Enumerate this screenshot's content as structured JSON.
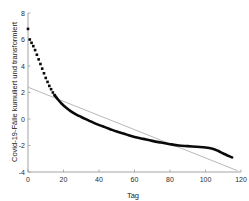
{
  "chart_data": {
    "type": "line",
    "title": "",
    "xlabel": "Tag",
    "ylabel": "Covid-19-Fälle kumuliert und transformiert",
    "xlim": [
      0,
      120
    ],
    "ylim": [
      -4,
      8
    ],
    "xticks": [
      0,
      20,
      40,
      60,
      80,
      100,
      120
    ],
    "xticklabels": [
      "0",
      "20",
      "40",
      "60",
      "80",
      "100",
      "120"
    ],
    "yticks": [
      -4,
      -2,
      0,
      2,
      4,
      6,
      8
    ],
    "yticklabels": [
      "-4",
      "-2",
      "0",
      "2",
      "4",
      "6",
      "8"
    ],
    "grid": false,
    "legend": null,
    "series": [
      {
        "name": "Beobachtet (gepunktet, früh)",
        "style": "markers-square",
        "color": "#0a0a0a",
        "x": [
          0,
          1,
          2,
          3,
          4,
          5,
          6,
          7,
          8,
          9,
          10,
          11,
          12,
          13,
          14,
          15
        ],
        "y": [
          6.8,
          6.0,
          5.75,
          5.5,
          5.2,
          4.85,
          4.5,
          4.15,
          3.8,
          3.45,
          3.1,
          2.8,
          2.5,
          2.25,
          2.0,
          1.8
        ]
      },
      {
        "name": "Beobachtet (durchgezogen, dick)",
        "style": "thick-line",
        "color": "#0a0a0a",
        "x": [
          15,
          17,
          19,
          21,
          24,
          27,
          30,
          34,
          38,
          42,
          46,
          50,
          55,
          60,
          65,
          70,
          75,
          80,
          85,
          90,
          95,
          100,
          104,
          107,
          110,
          115
        ],
        "y": [
          1.8,
          1.45,
          1.15,
          0.9,
          0.6,
          0.35,
          0.15,
          -0.1,
          -0.35,
          -0.55,
          -0.75,
          -0.95,
          -1.15,
          -1.35,
          -1.5,
          -1.65,
          -1.78,
          -1.9,
          -2.0,
          -2.05,
          -2.1,
          -2.15,
          -2.25,
          -2.4,
          -2.6,
          -2.9
        ]
      },
      {
        "name": "Linearer Trend",
        "style": "thin-line",
        "color": "#b0b0b0",
        "x": [
          0,
          118
        ],
        "y": [
          2.4,
          -3.9
        ]
      }
    ]
  },
  "axis": {
    "x_label": "Tag",
    "y_label": "Covid-19-Fälle kumuliert und transformiert"
  }
}
